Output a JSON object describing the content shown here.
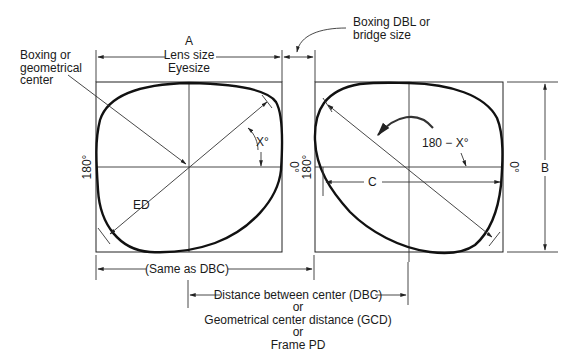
{
  "diagram": {
    "type": "boxing-system-frame-measurements",
    "labels": {
      "a": "A",
      "lens_size": "Lens size",
      "eyesize": "Eyesize",
      "boxing_center_line1": "Boxing or",
      "boxing_center_line2": "geometrical",
      "boxing_center_line3": "center",
      "dbl_line1": "Boxing DBL or",
      "dbl_line2": "bridge size",
      "left_180": "180°",
      "left_0": "0°",
      "right_180": "180°",
      "right_0": "0°",
      "x_angle": "X°",
      "ed": "ED",
      "rotation_angle": "180 − X°",
      "c": "C",
      "b": "B",
      "same_as_dbc": "(Same as DBC)",
      "dbc": "Distance between center (DBC)",
      "or1": "or",
      "gcd": "Geometrical center distance (GCD)",
      "or2": "or",
      "frame_pd": "Frame PD"
    }
  }
}
